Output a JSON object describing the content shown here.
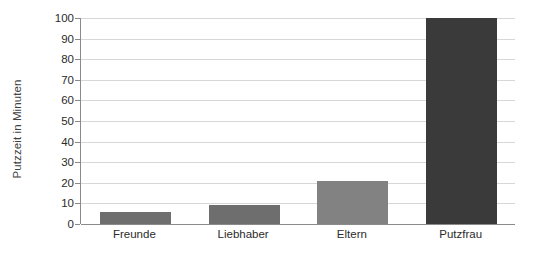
{
  "chart_data": {
    "type": "bar",
    "title": "",
    "xlabel": "",
    "ylabel": "Putzzeit in Minuten",
    "categories": [
      "Freunde",
      "Liebhaber",
      "Eltern",
      "Putzfrau"
    ],
    "values": [
      6,
      9,
      21,
      100
    ],
    "ylim": [
      0,
      100
    ],
    "ytick_labels": [
      "0",
      "10",
      "20",
      "30",
      "40",
      "50",
      "60",
      "70",
      "80",
      "90",
      "100"
    ],
    "ytick_values": [
      0,
      10,
      20,
      30,
      40,
      50,
      60,
      70,
      80,
      90,
      100
    ],
    "bar_colors": [
      "#6e6e6e",
      "#6e6e6e",
      "#828282",
      "#3a3a3a"
    ],
    "grid": "horizontal",
    "legend": "none",
    "background_color": "#ffffff",
    "gridline_color": "#d7d7d7",
    "axis_color": "#8a8a8a",
    "text_color": "#2b2b2b"
  }
}
